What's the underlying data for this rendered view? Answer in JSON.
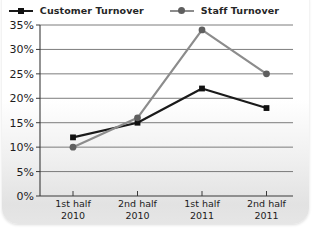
{
  "chart_data": {
    "type": "line",
    "title": "",
    "xlabel": "",
    "ylabel": "",
    "categories": [
      "1st half\n2010",
      "2nd half\n2010",
      "1st half\n2011",
      "2nd half\n2011"
    ],
    "series": [
      {
        "name": "Customer Turnover",
        "values": [
          12,
          15,
          22,
          18
        ],
        "color": "#1a1a1a",
        "marker": "square",
        "marker_color": "#111111"
      },
      {
        "name": "Staff Turnover",
        "values": [
          10,
          16,
          34,
          25
        ],
        "color": "#8c8c8c",
        "marker": "circle",
        "marker_color": "#5f5f5f"
      }
    ],
    "ylim": [
      0,
      35
    ],
    "yticks": [
      0,
      5,
      10,
      15,
      20,
      25,
      30,
      35
    ],
    "ytick_labels": [
      "0%",
      "5%",
      "10%",
      "15%",
      "20%",
      "25%",
      "30%",
      "35%"
    ],
    "grid": true,
    "legend_position": "top",
    "grid_color": "#6e6e6e",
    "axis_color": "#3a3a3a",
    "label_color": "#1c1c1c"
  }
}
